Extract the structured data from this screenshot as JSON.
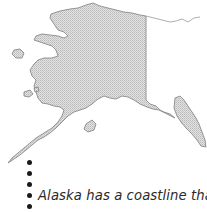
{
  "map": {
    "subject": "Alaska",
    "fill_color": "#d9d9d9",
    "stipple_color": "#b8b8b8",
    "outline_color": "#8a8a8a"
  },
  "bullets": {
    "count": 5,
    "color": "#1a1a1a"
  },
  "caption": {
    "line1": "Alaska has a coastline that is",
    "line2": ""
  }
}
